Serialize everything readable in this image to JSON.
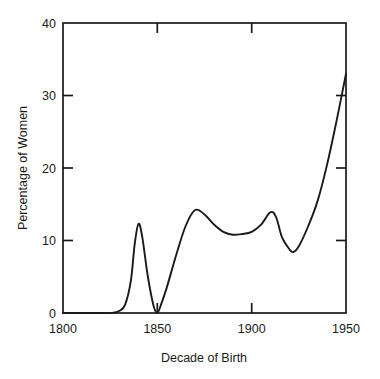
{
  "chart_data": {
    "type": "line",
    "title": "",
    "subtitle": "",
    "xlabel": "Decade of Birth",
    "ylabel": "Percentage of Women",
    "xlim": [
      1800,
      1950
    ],
    "ylim": [
      0,
      40
    ],
    "xticks": [
      1800,
      1850,
      1900,
      1950
    ],
    "xtick_labels": [
      "1800",
      "1850",
      "1900",
      "1950"
    ],
    "yticks": [
      0,
      10,
      20,
      30,
      40
    ],
    "ytick_labels": [
      "0",
      "10",
      "20",
      "30",
      "40"
    ],
    "grid": false,
    "legend": null,
    "legend_position": "none",
    "line_color": "#1a1a1a",
    "background_color": "#ffffff",
    "frame": "full-box-inward-ticks",
    "series": [
      {
        "name": "Percentage of Women",
        "x": [
          1800,
          1810,
          1820,
          1826,
          1830,
          1833,
          1836,
          1838,
          1840,
          1842,
          1845,
          1848,
          1850,
          1852,
          1855,
          1860,
          1865,
          1870,
          1875,
          1880,
          1885,
          1890,
          1895,
          1900,
          1905,
          1910,
          1913,
          1916,
          1920,
          1922,
          1925,
          1930,
          1935,
          1940,
          1945,
          1950
        ],
        "y": [
          0,
          0,
          0,
          0,
          0.3,
          1.2,
          4.5,
          9.5,
          12.3,
          10.5,
          5.0,
          1.0,
          0.0,
          1.2,
          3.5,
          8.0,
          12.0,
          14.2,
          13.6,
          12.2,
          11.2,
          10.8,
          10.9,
          11.2,
          12.2,
          13.9,
          13.2,
          10.5,
          8.8,
          8.4,
          9.2,
          12.0,
          15.5,
          20.5,
          26.5,
          33.0
        ]
      }
    ]
  },
  "axes": {
    "y_title": "Percentage of Women",
    "x_title": "Decade of Birth",
    "y_tick_40": "40",
    "y_tick_30": "30",
    "y_tick_20": "20",
    "y_tick_10": "10",
    "y_tick_0": "0",
    "x_tick_1800": "1800",
    "x_tick_1850": "1850",
    "x_tick_1900": "1900",
    "x_tick_1950": "1950"
  }
}
